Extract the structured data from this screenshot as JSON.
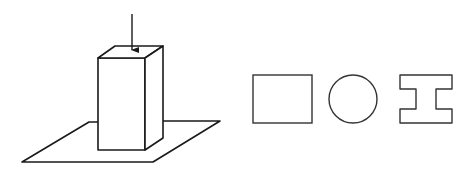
{
  "diagram": {
    "stroke_color": "#1a1a1a",
    "section_stroke_color": "#333333",
    "background": "#ffffff",
    "elements": {
      "load_arrow": {
        "label": "",
        "direction": "down"
      },
      "column": {
        "shape": "rectangular-prism"
      },
      "base_plate": {
        "shape": "parallelogram"
      },
      "cross_sections": [
        {
          "name": "rectangular-section",
          "shape": "rectangle"
        },
        {
          "name": "circular-section",
          "shape": "circle"
        },
        {
          "name": "i-beam-section",
          "shape": "I-shape"
        }
      ]
    }
  }
}
